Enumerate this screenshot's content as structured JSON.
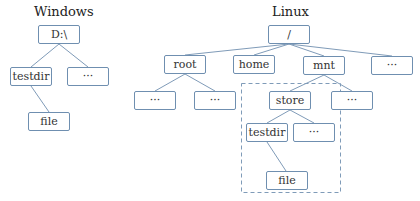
{
  "windows": {
    "title": "Windows",
    "nodes": {
      "root": "D:\\",
      "testdir": "testdir",
      "other": "···",
      "file": "file"
    }
  },
  "linux": {
    "title": "Linux",
    "nodes": {
      "root": "/",
      "root_dir": "root",
      "home": "home",
      "mnt": "mnt",
      "other_top": "···",
      "root_child1": "···",
      "root_child2": "···",
      "store": "store",
      "mnt_other": "···",
      "testdir": "testdir",
      "store_other": "···",
      "file": "file"
    }
  },
  "colors": {
    "edge": "#7f9bb8",
    "box_border": "#6f8fb0",
    "dashed_border": "#7f9bb8"
  }
}
